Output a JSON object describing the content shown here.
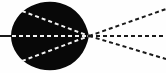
{
  "figure": {
    "width": 166,
    "height": 73,
    "background_color": "#fefefe",
    "body_color": "#080808",
    "inner_ray_color": "#f2f2f2",
    "outer_ray_color": "#1a1a1a"
  },
  "body": {
    "label": "dark-blob",
    "shape": "rounded-teardrop",
    "cx": 49,
    "cy": 36,
    "rx": 37,
    "ry": 34,
    "vertex_x": 89,
    "vertex_y": 36,
    "left_edge_x": 12,
    "top_edge_y": 2,
    "bottom_edge_y": 70,
    "fill": "#080808"
  },
  "axis": {
    "label": "optical-axis",
    "x1": 0,
    "y1": 36,
    "x2": 166,
    "y2": 36,
    "style": "dashed",
    "dash_pattern": "4 3",
    "stroke_width": 2
  },
  "vertex": {
    "label": "convergence-point",
    "x": 89,
    "y": 36
  },
  "chart_data": {
    "type": "scatter",
    "xlabel": "",
    "ylabel": "",
    "xlim": [
      0,
      166
    ],
    "ylim": [
      0,
      73
    ],
    "grid": false,
    "legend": "none",
    "series": [
      {
        "name": "inner-ray-upper",
        "color": "#f2f2f2",
        "style": "dashed",
        "x": [
          22,
          89
        ],
        "y": [
          11,
          36
        ]
      },
      {
        "name": "inner-ray-axis",
        "color": "#f2f2f2",
        "style": "dashed",
        "x": [
          12,
          89
        ],
        "y": [
          36,
          36
        ]
      },
      {
        "name": "inner-ray-lower",
        "color": "#f2f2f2",
        "style": "dashed",
        "x": [
          22,
          89
        ],
        "y": [
          61,
          36
        ]
      },
      {
        "name": "outer-ray-upper",
        "color": "#1a1a1a",
        "style": "dashed",
        "x": [
          89,
          166
        ],
        "y": [
          36,
          9
        ]
      },
      {
        "name": "outer-ray-axis",
        "color": "#1a1a1a",
        "style": "dashed",
        "x": [
          89,
          166
        ],
        "y": [
          36,
          36
        ]
      },
      {
        "name": "outer-ray-lower",
        "color": "#1a1a1a",
        "style": "dashed",
        "x": [
          89,
          166
        ],
        "y": [
          36,
          59
        ]
      },
      {
        "name": "incident-axis-left",
        "color": "#1a1a1a",
        "style": "solid",
        "x": [
          0,
          12
        ],
        "y": [
          36,
          36
        ]
      }
    ],
    "annotations": []
  }
}
